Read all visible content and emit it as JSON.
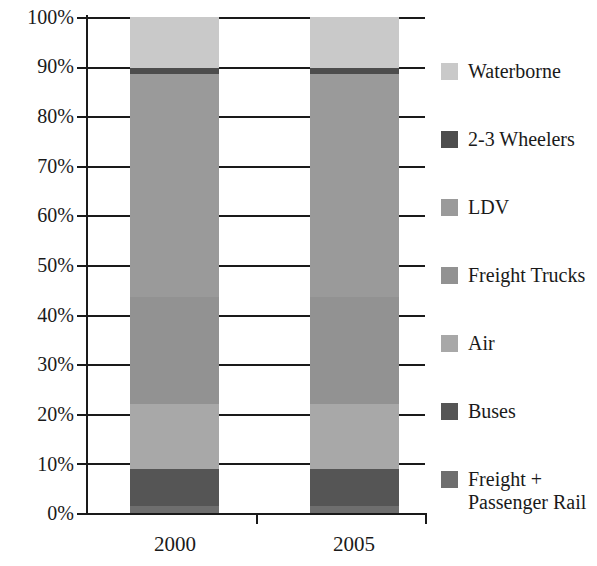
{
  "chart_data": {
    "type": "bar",
    "subtype": "stacked-percentage-column",
    "title": "",
    "xlabel": "",
    "ylabel": "",
    "categories": [
      "2000",
      "2005"
    ],
    "ylim": [
      0,
      100
    ],
    "ytick_labels": [
      "0%",
      "10%",
      "20%",
      "30%",
      "40%",
      "50%",
      "60%",
      "70%",
      "80%",
      "90%",
      "100%"
    ],
    "ytick_values": [
      0,
      10,
      20,
      30,
      40,
      50,
      60,
      70,
      80,
      90,
      100
    ],
    "grid": true,
    "grid_axis": "y",
    "legend_position": "right",
    "stack_order_bottom_to_top": [
      "Freight + Passenger Rail",
      "Buses",
      "Air",
      "Freight Trucks",
      "LDV",
      "2-3 Wheelers",
      "Waterborne"
    ],
    "series": [
      {
        "name": "Waterborne",
        "color": "#c9c9c9",
        "values": [
          10.2,
          10.2
        ],
        "cumulative_top": [
          100.0,
          100.0
        ]
      },
      {
        "name": "2-3 Wheelers",
        "color": "#4d4d4d",
        "values": [
          1.3,
          1.3
        ],
        "cumulative_top": [
          89.8,
          89.8
        ]
      },
      {
        "name": "LDV",
        "color": "#9a9a9a",
        "values": [
          45.0,
          45.0
        ],
        "cumulative_top": [
          88.5,
          88.5
        ]
      },
      {
        "name": "Freight Trucks",
        "color": "#929292",
        "values": [
          21.5,
          21.5
        ],
        "cumulative_top": [
          43.5,
          43.5
        ]
      },
      {
        "name": "Air",
        "color": "#a8a8a8",
        "values": [
          13.2,
          13.2
        ],
        "cumulative_top": [
          22.0,
          22.0
        ]
      },
      {
        "name": "Buses",
        "color": "#555555",
        "values": [
          7.3,
          7.3
        ],
        "cumulative_top": [
          8.8,
          8.8
        ]
      },
      {
        "name": "Freight + Passenger Rail",
        "color": "#6e6e6e",
        "values": [
          1.5,
          1.5
        ],
        "cumulative_top": [
          1.5,
          1.5
        ]
      }
    ]
  },
  "axis": {
    "y_labels": {
      "t100": "100%",
      "t90": "90%",
      "t80": "80%",
      "t70": "70%",
      "t60": "60%",
      "t50": "50%",
      "t40": "40%",
      "t30": "30%",
      "t20": "20%",
      "t10": "10%",
      "t0": "0%"
    },
    "x_labels": {
      "c0": "2000",
      "c1": "2005"
    }
  },
  "legend": {
    "items": [
      {
        "label": "Waterborne",
        "color": "#c9c9c9"
      },
      {
        "label": "2-3 Wheelers",
        "color": "#4d4d4d"
      },
      {
        "label": "LDV",
        "color": "#9a9a9a"
      },
      {
        "label": "Freight Trucks",
        "color": "#929292"
      },
      {
        "label": "Air",
        "color": "#a8a8a8"
      },
      {
        "label": "Buses",
        "color": "#555555"
      },
      {
        "label": "Freight +\nPassenger Rail",
        "color": "#6e6e6e"
      }
    ]
  },
  "style": {
    "axis_color": "#1a1a1a",
    "background": "#ffffff"
  }
}
